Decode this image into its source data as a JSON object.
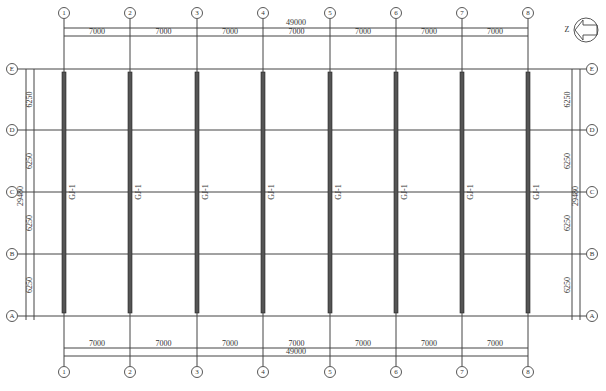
{
  "drawing": {
    "type": "structural-floor-plan",
    "colors": {
      "line": "#444444",
      "beam_fill": "#555555",
      "text": "#333333",
      "background": "#ffffff"
    },
    "column_axes": [
      {
        "label": "1",
        "x": 64
      },
      {
        "label": "2",
        "x": 130
      },
      {
        "label": "3",
        "x": 197
      },
      {
        "label": "4",
        "x": 263
      },
      {
        "label": "5",
        "x": 330
      },
      {
        "label": "6",
        "x": 396
      },
      {
        "label": "7",
        "x": 462
      },
      {
        "label": "8",
        "x": 528
      }
    ],
    "row_axes": [
      {
        "label": "E",
        "y": 69
      },
      {
        "label": "D",
        "y": 130
      },
      {
        "label": "C",
        "y": 192
      },
      {
        "label": "B",
        "y": 254
      },
      {
        "label": "A",
        "y": 316
      }
    ],
    "top_dimensions": {
      "overall": "49000",
      "bays": [
        "7000",
        "7000",
        "7000",
        "7000",
        "7000",
        "7000",
        "7000"
      ]
    },
    "bottom_dimensions": {
      "overall": "49000",
      "bays": [
        "7000",
        "7000",
        "7000",
        "7000",
        "7000",
        "7000",
        "7000"
      ]
    },
    "left_dimensions": {
      "overall": "29480",
      "bays": [
        "6250",
        "6250",
        "6250",
        "6250"
      ]
    },
    "right_dimensions": {
      "overall": "29480",
      "bays": [
        "6250",
        "6250",
        "6250",
        "6250"
      ]
    },
    "beams": {
      "label": "GJ-1",
      "count": 8,
      "y_top": 72,
      "y_bottom": 313
    },
    "north_arrow": {
      "label": "Z",
      "icon": "north-arrow-icon"
    }
  }
}
